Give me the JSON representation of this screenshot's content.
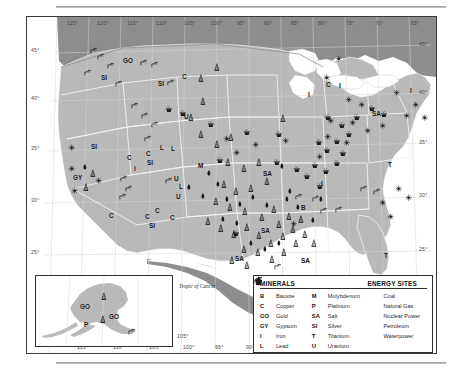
{
  "map": {
    "title": "United States Mineral and Energy Resources",
    "tropic_label": "Tropic of Cancer",
    "colors": {
      "land": "#b9b9b9",
      "neighbor_land": "#8d8d8d",
      "water": "#ffffff",
      "border": "#2e2e2e",
      "state_line": "#f2f2f2",
      "coal": "#1a1a1a",
      "grid": "#d8d8d8"
    },
    "longitude_top": [
      "125°",
      "120°",
      "115°",
      "110°",
      "105°",
      "100°",
      "95°",
      "90°",
      "85°",
      "80°",
      "75°",
      "70°",
      "65°"
    ],
    "longitude_bottom": [
      "115°",
      "110°",
      "105°",
      "100°",
      "95°",
      "90°",
      "85°",
      "80°",
      "75°"
    ],
    "latitude_left": [
      "45°",
      "40°",
      "35°",
      "30°",
      "25°"
    ],
    "latitude_right": [
      "45°",
      "40°",
      "35°",
      "30°",
      "25°"
    ],
    "alaska_longitude": [
      "115°",
      "110°",
      "105°"
    ]
  },
  "legend": {
    "minerals_title": "MINERALS",
    "energy_title": "ENERGY SITES",
    "minerals_col1": [
      {
        "symbol": "B",
        "label": "Bauxite"
      },
      {
        "symbol": "C",
        "label": "Copper"
      },
      {
        "symbol": "GO",
        "label": "Gold"
      },
      {
        "symbol": "GY",
        "label": "Gypsum"
      },
      {
        "symbol": "I",
        "label": "Iron"
      },
      {
        "symbol": "L",
        "label": "Lead"
      }
    ],
    "minerals_col2": [
      {
        "symbol": "M",
        "label": "Molybdenum"
      },
      {
        "symbol": "P",
        "label": "Platinum"
      },
      {
        "symbol": "SA",
        "label": "Salt"
      },
      {
        "symbol": "SI",
        "label": "Silver"
      },
      {
        "symbol": "T",
        "label": "Titanium"
      },
      {
        "symbol": "U",
        "label": "Uranium"
      }
    ],
    "energy": [
      {
        "icon": "coal-icon",
        "label": "Coal"
      },
      {
        "icon": "natural-gas-icon",
        "label": "Natural Gas"
      },
      {
        "icon": "nuclear-power-icon",
        "label": "Nuclear Power"
      },
      {
        "icon": "petroleum-icon",
        "label": "Petroleum"
      },
      {
        "icon": "waterpower-icon",
        "label": "Waterpower"
      }
    ]
  },
  "mineral_markers": [
    {
      "t": "GO",
      "x": 96,
      "y": 40
    },
    {
      "t": "SI",
      "x": 74,
      "y": 57
    },
    {
      "t": "SI",
      "x": 131,
      "y": 63
    },
    {
      "t": "C",
      "x": 155,
      "y": 56
    },
    {
      "t": "U",
      "x": 157,
      "y": 96
    },
    {
      "t": "SI",
      "x": 64,
      "y": 126
    },
    {
      "t": "C",
      "x": 119,
      "y": 133
    },
    {
      "t": "SI",
      "x": 120,
      "y": 142
    },
    {
      "t": "L",
      "x": 133,
      "y": 127
    },
    {
      "t": "C",
      "x": 100,
      "y": 137
    },
    {
      "t": "I",
      "x": 107,
      "y": 148
    },
    {
      "t": "M",
      "x": 171,
      "y": 145
    },
    {
      "t": "U",
      "x": 147,
      "y": 158
    },
    {
      "t": "L",
      "x": 152,
      "y": 166
    },
    {
      "t": "U",
      "x": 149,
      "y": 176
    },
    {
      "t": "GY",
      "x": 46,
      "y": 157
    },
    {
      "t": "C",
      "x": 82,
      "y": 195
    },
    {
      "t": "C",
      "x": 118,
      "y": 196
    },
    {
      "t": "C",
      "x": 128,
      "y": 190
    },
    {
      "t": "SI",
      "x": 122,
      "y": 205
    },
    {
      "t": "C",
      "x": 143,
      "y": 197
    },
    {
      "t": "SA",
      "x": 236,
      "y": 153
    },
    {
      "t": "SA",
      "x": 234,
      "y": 210
    },
    {
      "t": "SA",
      "x": 208,
      "y": 238
    },
    {
      "t": "SA",
      "x": 274,
      "y": 240
    },
    {
      "t": "B",
      "x": 274,
      "y": 187
    },
    {
      "t": "I",
      "x": 281,
      "y": 74
    },
    {
      "t": "C",
      "x": 299,
      "y": 64
    },
    {
      "t": "I",
      "x": 312,
      "y": 65
    },
    {
      "t": "SA",
      "x": 345,
      "y": 93
    },
    {
      "t": "I",
      "x": 383,
      "y": 70
    },
    {
      "t": "I",
      "x": 294,
      "y": 163
    },
    {
      "t": "T",
      "x": 361,
      "y": 144
    },
    {
      "t": "T",
      "x": 357,
      "y": 235
    },
    {
      "t": "L",
      "x": 144,
      "y": 128
    }
  ],
  "energy_markers": [
    {
      "k": "waterpower",
      "x": 63,
      "y": 30
    },
    {
      "k": "waterpower",
      "x": 80,
      "y": 45
    },
    {
      "k": "waterpower",
      "x": 57,
      "y": 52
    },
    {
      "k": "waterpower",
      "x": 88,
      "y": 63
    },
    {
      "k": "waterpower",
      "x": 113,
      "y": 42
    },
    {
      "k": "waterpower",
      "x": 124,
      "y": 44
    },
    {
      "k": "waterpower",
      "x": 140,
      "y": 62
    },
    {
      "k": "waterpower",
      "x": 93,
      "y": 158
    },
    {
      "k": "waterpower",
      "x": 98,
      "y": 168
    },
    {
      "k": "waterpower",
      "x": 92,
      "y": 176
    },
    {
      "k": "waterpower",
      "x": 138,
      "y": 160
    },
    {
      "k": "waterpower",
      "x": 104,
      "y": 85
    },
    {
      "k": "waterpower",
      "x": 114,
      "y": 95
    },
    {
      "k": "waterpower",
      "x": 124,
      "y": 104
    },
    {
      "k": "waterpower",
      "x": 117,
      "y": 118
    },
    {
      "k": "waterpower",
      "x": 268,
      "y": 176
    },
    {
      "k": "waterpower",
      "x": 285,
      "y": 178
    },
    {
      "k": "waterpower",
      "x": 293,
      "y": 190
    },
    {
      "k": "waterpower",
      "x": 308,
      "y": 189
    },
    {
      "k": "waterpower",
      "x": 333,
      "y": 168
    },
    {
      "k": "waterpower",
      "x": 346,
      "y": 171
    },
    {
      "k": "waterpower",
      "x": 247,
      "y": 246
    },
    {
      "k": "waterpower",
      "x": 70,
      "y": 36
    },
    {
      "k": "nuclear",
      "x": 41,
      "y": 127
    },
    {
      "k": "nuclear",
      "x": 41,
      "y": 148
    },
    {
      "k": "nuclear",
      "x": 44,
      "y": 170
    },
    {
      "k": "nuclear",
      "x": 68,
      "y": 160
    },
    {
      "k": "nuclear",
      "x": 196,
      "y": 118
    },
    {
      "k": "nuclear",
      "x": 206,
      "y": 132
    },
    {
      "k": "nuclear",
      "x": 225,
      "y": 124
    },
    {
      "k": "nuclear",
      "x": 296,
      "y": 57
    },
    {
      "k": "nuclear",
      "x": 308,
      "y": 38
    },
    {
      "k": "nuclear",
      "x": 318,
      "y": 79
    },
    {
      "k": "nuclear",
      "x": 331,
      "y": 84
    },
    {
      "k": "nuclear",
      "x": 366,
      "y": 72
    },
    {
      "k": "nuclear",
      "x": 376,
      "y": 95
    },
    {
      "k": "nuclear",
      "x": 385,
      "y": 84
    },
    {
      "k": "nuclear",
      "x": 394,
      "y": 97
    },
    {
      "k": "nuclear",
      "x": 352,
      "y": 105
    },
    {
      "k": "nuclear",
      "x": 337,
      "y": 110
    },
    {
      "k": "nuclear",
      "x": 322,
      "y": 102
    },
    {
      "k": "nuclear",
      "x": 316,
      "y": 122
    },
    {
      "k": "nuclear",
      "x": 297,
      "y": 116
    },
    {
      "k": "nuclear",
      "x": 289,
      "y": 136
    },
    {
      "k": "nuclear",
      "x": 300,
      "y": 100
    },
    {
      "k": "nuclear",
      "x": 352,
      "y": 182
    },
    {
      "k": "nuclear",
      "x": 360,
      "y": 196
    },
    {
      "k": "nuclear",
      "x": 378,
      "y": 177
    },
    {
      "k": "nuclear",
      "x": 368,
      "y": 168
    },
    {
      "k": "nuclear",
      "x": 263,
      "y": 203
    },
    {
      "k": "nuclear",
      "x": 255,
      "y": 120
    },
    {
      "k": "coal",
      "x": 180,
      "y": 103
    },
    {
      "k": "coal",
      "x": 189,
      "y": 139
    },
    {
      "k": "coal",
      "x": 246,
      "y": 141
    },
    {
      "k": "coal",
      "x": 248,
      "y": 113
    },
    {
      "k": "coal",
      "x": 205,
      "y": 212
    },
    {
      "k": "coal",
      "x": 289,
      "y": 165
    },
    {
      "k": "coal",
      "x": 216,
      "y": 111
    },
    {
      "k": "coal",
      "x": 297,
      "y": 96
    },
    {
      "k": "coal",
      "x": 311,
      "y": 104
    },
    {
      "k": "coal",
      "x": 326,
      "y": 96
    },
    {
      "k": "coal",
      "x": 318,
      "y": 113
    },
    {
      "k": "coal",
      "x": 306,
      "y": 120
    },
    {
      "k": "coal",
      "x": 296,
      "y": 129
    },
    {
      "k": "coal",
      "x": 288,
      "y": 121
    },
    {
      "k": "coal",
      "x": 284,
      "y": 144
    },
    {
      "k": "coal",
      "x": 295,
      "y": 150
    },
    {
      "k": "coal",
      "x": 306,
      "y": 142
    },
    {
      "k": "coal",
      "x": 312,
      "y": 132
    },
    {
      "k": "coal",
      "x": 276,
      "y": 155
    },
    {
      "k": "coal",
      "x": 266,
      "y": 148
    },
    {
      "k": "coal",
      "x": 341,
      "y": 87
    },
    {
      "k": "coal",
      "x": 353,
      "y": 93
    },
    {
      "k": "coal",
      "x": 138,
      "y": 88
    },
    {
      "k": "coal",
      "x": 152,
      "y": 92
    },
    {
      "k": "petroleum",
      "x": 170,
      "y": 57
    },
    {
      "k": "petroleum",
      "x": 186,
      "y": 46
    },
    {
      "k": "petroleum",
      "x": 170,
      "y": 113
    },
    {
      "k": "petroleum",
      "x": 186,
      "y": 123
    },
    {
      "k": "petroleum",
      "x": 200,
      "y": 116
    },
    {
      "k": "petroleum",
      "x": 197,
      "y": 141
    },
    {
      "k": "petroleum",
      "x": 213,
      "y": 147
    },
    {
      "k": "petroleum",
      "x": 228,
      "y": 141
    },
    {
      "k": "petroleum",
      "x": 236,
      "y": 160
    },
    {
      "k": "petroleum",
      "x": 220,
      "y": 167
    },
    {
      "k": "petroleum",
      "x": 205,
      "y": 170
    },
    {
      "k": "petroleum",
      "x": 193,
      "y": 163
    },
    {
      "k": "petroleum",
      "x": 185,
      "y": 180
    },
    {
      "k": "petroleum",
      "x": 199,
      "y": 186
    },
    {
      "k": "petroleum",
      "x": 214,
      "y": 190
    },
    {
      "k": "petroleum",
      "x": 231,
      "y": 196
    },
    {
      "k": "petroleum",
      "x": 243,
      "y": 188
    },
    {
      "k": "petroleum",
      "x": 177,
      "y": 200
    },
    {
      "k": "petroleum",
      "x": 190,
      "y": 207
    },
    {
      "k": "petroleum",
      "x": 203,
      "y": 213
    },
    {
      "k": "petroleum",
      "x": 216,
      "y": 206
    },
    {
      "k": "petroleum",
      "x": 228,
      "y": 214
    },
    {
      "k": "petroleum",
      "x": 240,
      "y": 222
    },
    {
      "k": "petroleum",
      "x": 252,
      "y": 215
    },
    {
      "k": "petroleum",
      "x": 227,
      "y": 231
    },
    {
      "k": "petroleum",
      "x": 213,
      "y": 228
    },
    {
      "k": "petroleum",
      "x": 241,
      "y": 238
    },
    {
      "k": "petroleum",
      "x": 216,
      "y": 244
    },
    {
      "k": "petroleum",
      "x": 201,
      "y": 239
    },
    {
      "k": "petroleum",
      "x": 253,
      "y": 231
    },
    {
      "k": "petroleum",
      "x": 265,
      "y": 222
    },
    {
      "k": "petroleum",
      "x": 262,
      "y": 208
    },
    {
      "k": "petroleum",
      "x": 274,
      "y": 213
    },
    {
      "k": "petroleum",
      "x": 283,
      "y": 222
    },
    {
      "k": "petroleum",
      "x": 258,
      "y": 195
    },
    {
      "k": "petroleum",
      "x": 270,
      "y": 198
    },
    {
      "k": "petroleum",
      "x": 248,
      "y": 203
    },
    {
      "k": "petroleum",
      "x": 55,
      "y": 166
    },
    {
      "k": "petroleum",
      "x": 62,
      "y": 152
    },
    {
      "k": "petroleum",
      "x": 160,
      "y": 96
    },
    {
      "k": "petroleum",
      "x": 172,
      "y": 80
    },
    {
      "k": "petroleum",
      "x": 252,
      "y": 97
    },
    {
      "k": "gas",
      "x": 54,
      "y": 146
    },
    {
      "k": "gas",
      "x": 158,
      "y": 166
    },
    {
      "k": "gas",
      "x": 178,
      "y": 152
    },
    {
      "k": "gas",
      "x": 187,
      "y": 163
    },
    {
      "k": "gas",
      "x": 172,
      "y": 175
    },
    {
      "k": "gas",
      "x": 196,
      "y": 178
    },
    {
      "k": "gas",
      "x": 209,
      "y": 183
    },
    {
      "k": "gas",
      "x": 222,
      "y": 176
    },
    {
      "k": "gas",
      "x": 236,
      "y": 184
    },
    {
      "k": "gas",
      "x": 192,
      "y": 198
    },
    {
      "k": "gas",
      "x": 206,
      "y": 202
    },
    {
      "k": "gas",
      "x": 220,
      "y": 222
    },
    {
      "k": "gas",
      "x": 234,
      "y": 228
    },
    {
      "k": "gas",
      "x": 248,
      "y": 222
    },
    {
      "k": "gas",
      "x": 256,
      "y": 178
    },
    {
      "k": "gas",
      "x": 267,
      "y": 186
    },
    {
      "k": "gas",
      "x": 290,
      "y": 178
    },
    {
      "k": "gas",
      "x": 259,
      "y": 170
    },
    {
      "k": "gas",
      "x": 282,
      "y": 199
    },
    {
      "k": "gas",
      "x": 251,
      "y": 145
    }
  ],
  "alaska": {
    "labels": [
      {
        "t": "GO",
        "x": 44,
        "y": 27
      },
      {
        "t": "GO",
        "x": 73,
        "y": 37
      },
      {
        "t": "P",
        "x": 48,
        "y": 45
      }
    ],
    "markers": [
      {
        "k": "petroleum",
        "x": 64,
        "y": 16
      },
      {
        "k": "petroleum",
        "x": 63,
        "y": 39
      },
      {
        "k": "waterpower",
        "x": 92,
        "y": 52
      }
    ]
  }
}
